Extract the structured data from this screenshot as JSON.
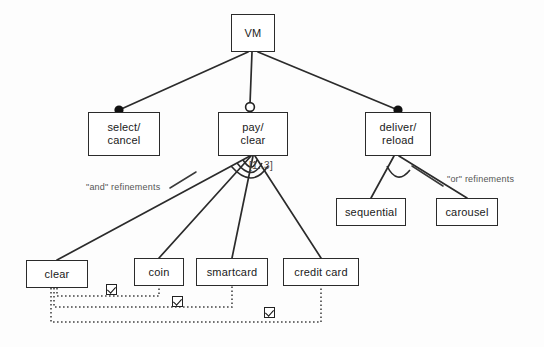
{
  "diagram": {
    "background": "#fdfdfd",
    "line_color": "#2b2b2b",
    "nodes": [
      {
        "id": "vm",
        "label_lines": [
          "VM"
        ],
        "x": 231,
        "y": 14,
        "w": 44,
        "h": 38
      },
      {
        "id": "select",
        "label_lines": [
          "select/",
          "cancel"
        ],
        "x": 88,
        "y": 112,
        "w": 72,
        "h": 44
      },
      {
        "id": "pay",
        "label_lines": [
          "pay/",
          "clear"
        ],
        "x": 218,
        "y": 112,
        "w": 70,
        "h": 44
      },
      {
        "id": "deliver",
        "label_lines": [
          "deliver/",
          "reload"
        ],
        "x": 365,
        "y": 112,
        "w": 66,
        "h": 44
      },
      {
        "id": "sequential",
        "label_lines": [
          "sequential"
        ],
        "x": 336,
        "y": 198,
        "w": 70,
        "h": 28
      },
      {
        "id": "carousel",
        "label_lines": [
          "carousel"
        ],
        "x": 436,
        "y": 198,
        "w": 62,
        "h": 28
      },
      {
        "id": "clear",
        "label_lines": [
          "clear"
        ],
        "x": 26,
        "y": 260,
        "w": 62,
        "h": 28
      },
      {
        "id": "coin",
        "label_lines": [
          "coin"
        ],
        "x": 134,
        "y": 258,
        "w": 50,
        "h": 28
      },
      {
        "id": "smartcard",
        "label_lines": [
          "smartcard"
        ],
        "x": 196,
        "y": 258,
        "w": 72,
        "h": 28
      },
      {
        "id": "creditcard",
        "label_lines": [
          "credit card"
        ],
        "x": 283,
        "y": 258,
        "w": 76,
        "h": 28
      }
    ],
    "annotations": [
      {
        "id": "and-refinements",
        "text": "\"and\" refinements",
        "x": 86,
        "y": 182
      },
      {
        "id": "or-refinements",
        "text": "\"or\"  refinements",
        "x": 447,
        "y": 174
      }
    ],
    "cardinality": {
      "id": "pay-cardinality",
      "text": "[1..3]",
      "x": 249,
      "y": 160
    },
    "checkboxes": [
      {
        "id": "checkbox-1",
        "checked": true,
        "x": 106,
        "y": 284
      },
      {
        "id": "checkbox-2",
        "checked": true,
        "x": 172,
        "y": 296
      },
      {
        "id": "checkbox-3",
        "checked": true,
        "x": 264,
        "y": 307
      }
    ],
    "refinement_markers": [
      {
        "id": "marker-select",
        "type": "filled-dot",
        "x": 119,
        "y": 110
      },
      {
        "id": "marker-pay",
        "type": "hollow-circle",
        "x": 250,
        "y": 108
      },
      {
        "id": "marker-deliver",
        "type": "filled-dot",
        "x": 398,
        "y": 110
      }
    ]
  }
}
